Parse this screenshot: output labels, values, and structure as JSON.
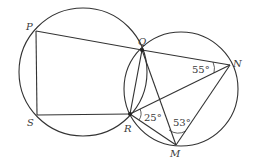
{
  "diagram": {
    "type": "geometry-two-intersecting-circles",
    "points": {
      "P": {
        "label": "P",
        "x": 36,
        "y": 31
      },
      "Q": {
        "label": "Q",
        "x": 142,
        "y": 50
      },
      "N": {
        "label": "N",
        "x": 230,
        "y": 65
      },
      "S": {
        "label": "S",
        "x": 37,
        "y": 115
      },
      "R": {
        "label": "R",
        "x": 130,
        "y": 114
      },
      "M": {
        "label": "M",
        "x": 176,
        "y": 145
      }
    },
    "circles": [
      {
        "name": "left-circle",
        "cx": 83,
        "cy": 72,
        "r": 64
      },
      {
        "name": "right-circle",
        "cx": 181,
        "cy": 89,
        "r": 57
      }
    ],
    "segments": [
      "PQ",
      "QN",
      "PS",
      "SR",
      "QR",
      "QM",
      "RN",
      "RM",
      "MN"
    ],
    "angles": [
      {
        "name": "angle-QNR",
        "vertex": "N",
        "label": "55°"
      },
      {
        "name": "angle-NRM",
        "vertex": "R",
        "label": "25°"
      },
      {
        "name": "angle-RMN",
        "vertex": "M",
        "label": "53°"
      }
    ],
    "colors": {
      "stroke": "#333333",
      "text": "#3a3a3a",
      "background": "#ffffff"
    }
  }
}
